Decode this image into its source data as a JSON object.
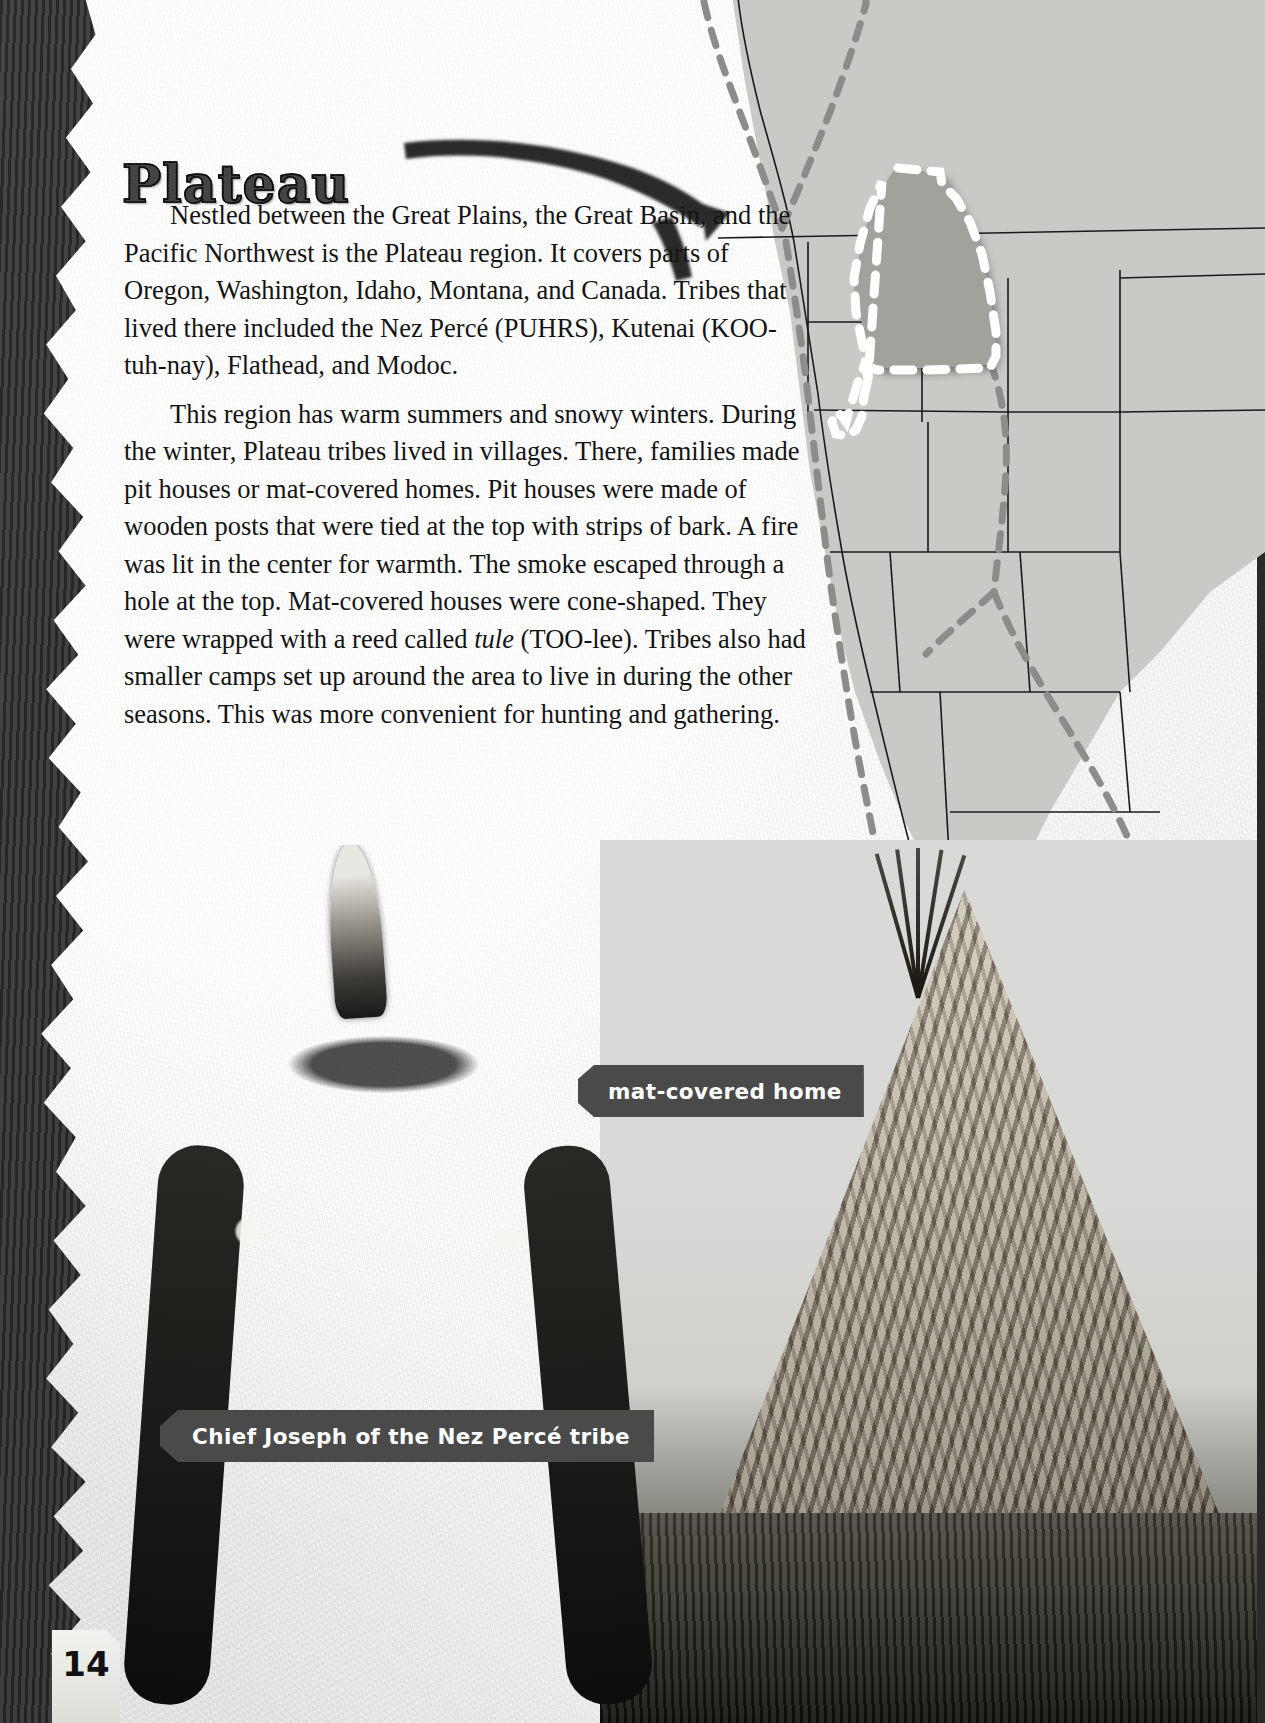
{
  "page": {
    "number": "14",
    "title": "Plateau"
  },
  "body": {
    "paragraphs": [
      "Nestled between the Great Plains, the Great Basin, and the Pacific Northwest is the Plateau region.  It covers parts of Oregon, Washington, Idaho, Montana, and Canada.  Tribes that lived there included the Nez Percé (PUHRS), Kutenai (KOO-tuh-nay), Flathead, and Modoc.",
      {
        "before": "This region has warm summers and snowy winters.  During the winter, Plateau tribes lived in villages.  There, families made pit houses or mat-covered homes.  Pit houses were made of wooden posts that were tied at the top with strips of bark.  A fire was lit in the center for warmth.  The smoke escaped through a hole at the top.  Mat-covered houses were cone-shaped.  They were wrapped with a reed called ",
        "italic": "tule",
        "after": " (TOO-lee).  Tribes also had smaller camps set up around the area to live in during the other seasons.  This was more convenient for hunting and gathering."
      }
    ]
  },
  "captions": [
    {
      "id": "mat-covered-home",
      "text": "mat-covered home"
    },
    {
      "id": "chief-joseph",
      "text": "Chief Joseph of the Nez Percé tribe"
    }
  ],
  "map": {
    "alt_name": "map-of-western-north-america",
    "highlight_label": "Plateau culture region",
    "highlighted_states": [
      "Oregon",
      "Washington",
      "Idaho",
      "Montana",
      "Northern California",
      "British Columbia"
    ],
    "colors": {
      "land": "#c9c9c5",
      "highlight_fill": "#a8a8a4",
      "highlight_outline": "#ffffff",
      "border_line": "#1a1a1a",
      "dashed_region": "#8d8d8d"
    }
  },
  "photos": [
    {
      "id": "chief-joseph-portrait",
      "subject": "Chief Joseph of the Nez Percé tribe"
    },
    {
      "id": "mat-covered-home-photo",
      "subject": "mat-covered home"
    }
  ],
  "theme": {
    "paper": "#efefec",
    "backdrop": "#333333",
    "tag_background": "#4a4a4a",
    "tag_text": "#ffffff",
    "text": "#141414"
  }
}
